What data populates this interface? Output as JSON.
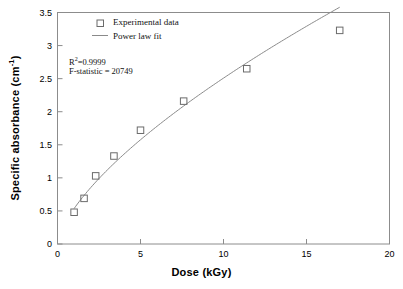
{
  "chart_data": {
    "type": "scatter",
    "title": "",
    "xlabel": "Dose (kGy)",
    "ylabel": "Specific absorbance (cm⁻¹)",
    "xlim": [
      0,
      20
    ],
    "ylim": [
      0,
      3.5
    ],
    "grid": false,
    "xticks": [
      "0",
      "5",
      "10",
      "15",
      "20"
    ],
    "xtick_values": [
      0,
      5,
      10,
      15,
      20
    ],
    "yticks": [
      "0",
      "0.5",
      "1",
      "1.5",
      "2",
      "2.5",
      "3",
      "3.5"
    ],
    "ytick_values": [
      0,
      0.5,
      1,
      1.5,
      2,
      2.5,
      3,
      3.5
    ],
    "legend_position": "top-left-inside",
    "series": [
      {
        "name": "Experimental data",
        "marker": "open-square",
        "color": "#6b6b6b",
        "x": [
          1.0,
          1.6,
          2.3,
          3.4,
          5.0,
          7.6,
          11.4,
          17.0
        ],
        "values": [
          0.48,
          0.69,
          1.03,
          1.33,
          1.72,
          2.16,
          2.65,
          3.23
        ]
      },
      {
        "name": "Power law fit",
        "marker": "line",
        "color": "#8a8a8a",
        "x": [
          1.0,
          1.6,
          2.3,
          3.4,
          5.0,
          7.6,
          11.4,
          17.0
        ],
        "values": [
          0.48,
          0.69,
          1.03,
          1.33,
          1.72,
          2.16,
          2.65,
          3.23
        ]
      }
    ],
    "annotations": [
      {
        "text": "R²=0.9999",
        "base": "R",
        "sup": "2",
        "rest": "=0.9999",
        "x": 1.5,
        "y": 2.85
      },
      {
        "text": "F-statistic = 20749",
        "base": "F-statistic = 20749",
        "sup": "",
        "rest": "",
        "x": 1.5,
        "y": 2.68
      }
    ]
  },
  "legend": {
    "items": [
      {
        "label": "Experimental data",
        "symbol": "open-square"
      },
      {
        "label": "Power law fit",
        "symbol": "line"
      }
    ]
  },
  "axes": {
    "x_title": "Dose (kGy)",
    "y_title_main": "Specific absorbance (cm",
    "y_title_sup": "-1",
    "y_title_tail": ")"
  },
  "colors": {
    "axis": "#808080",
    "marker": "#6b6b6b",
    "line": "#8a8a8a",
    "text": "#000000",
    "background": "#ffffff"
  }
}
